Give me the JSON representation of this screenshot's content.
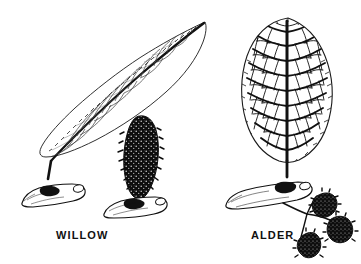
{
  "plate": {
    "kind": "botanical-line-illustration",
    "background_color": "#ffffff",
    "ink_color": "#111111",
    "width": 361,
    "height": 264,
    "caption_style": "bold-sans-uppercase"
  },
  "labels": {
    "willow": "WILLOW",
    "alder": "ALDER"
  },
  "specimens": [
    {
      "id": "willow",
      "label": "WILLOW",
      "leaf": {
        "shape": "lanceolate",
        "apex": "long-acuminate",
        "margin": "finely serrate",
        "venation": "pinnate, fine, light lines",
        "orientation": "diagonal, tip upper-right",
        "fill": "white"
      },
      "twig": {
        "form": "cut horizontal branch segment",
        "position": "lower-left",
        "cut_end": "pale oval"
      },
      "catkin": {
        "count": 1,
        "form": "elongate cone, erect",
        "texture": "dense speckled scales",
        "fill": "solid black"
      }
    },
    {
      "id": "alder",
      "label": "ALDER",
      "leaf": {
        "shape": "broadly obovate",
        "apex": "rounded",
        "margin": "serrate",
        "venation": "pinnate with dense reticulate network",
        "orientation": "upright",
        "fill": "white"
      },
      "twig": {
        "form": "cut horizontal branch segment",
        "position": "below leaf",
        "cut_end": "pale oval"
      },
      "cones": {
        "count": 3,
        "form": "small ovoid woody cones on slender stalks",
        "texture": "scaly",
        "fill": "solid black"
      }
    }
  ],
  "colors": {
    "ink": "#111111",
    "paper": "#ffffff",
    "vein_light": "#4a4a4a"
  }
}
